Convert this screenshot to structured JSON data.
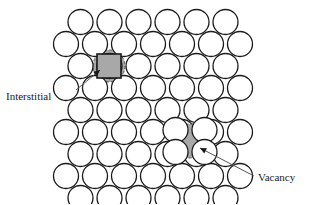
{
  "figure": {
    "background_color": "#ffffff",
    "atom_outline_color": "#1a1a1a",
    "atom_fill_color": "#ffffff",
    "defect_fill_color": "#a8a8a8",
    "defect_outline_color": "#555555",
    "leader_line_color": "#555555",
    "text_color": "#1a1a1a"
  },
  "labels": {
    "interstitial": "Interstitial",
    "vacancy": "Vacancy"
  },
  "lattice": {
    "atom_radius": 12.5,
    "row_spacing": 22,
    "col_spacing": 29,
    "origin_x": 66,
    "origin_y": 22,
    "rows": [
      {
        "index": 0,
        "count": 6,
        "offset": 14.5
      },
      {
        "index": 1,
        "count": 7,
        "offset": 0
      },
      {
        "index": 2,
        "count": 6,
        "offset": 14.5
      },
      {
        "index": 3,
        "count": 7,
        "offset": 0
      },
      {
        "index": 4,
        "count": 6,
        "offset": 14.5
      },
      {
        "index": 5,
        "count": 7,
        "offset": 0
      },
      {
        "index": 6,
        "count": 6,
        "offset": 14.5
      },
      {
        "index": 7,
        "count": 7,
        "offset": 0
      },
      {
        "index": 8,
        "count": 6,
        "offset": 14.5
      }
    ]
  },
  "defects": [
    {
      "type": "interstitial",
      "shape": "circle-with-square",
      "center_x": 109,
      "center_y": 66,
      "circle_radius": 16,
      "square_size": 24,
      "fill": "#a8a8a8",
      "dash": "3,2"
    },
    {
      "type": "vacancy",
      "shape": "circle",
      "center_x": 190,
      "center_y": 141,
      "circle_radius": 17,
      "fill": "#a8a8a8",
      "dash": "3,2"
    }
  ],
  "leaders": [
    {
      "name": "interstitial-leader",
      "from_x": 76,
      "from_y": 90,
      "to_x": 100,
      "to_y": 70,
      "arrow_angle": -40
    },
    {
      "name": "vacancy-leader",
      "from_x": 254,
      "from_y": 176,
      "to_x": 200,
      "to_y": 148,
      "arrow_angle": 207
    }
  ]
}
